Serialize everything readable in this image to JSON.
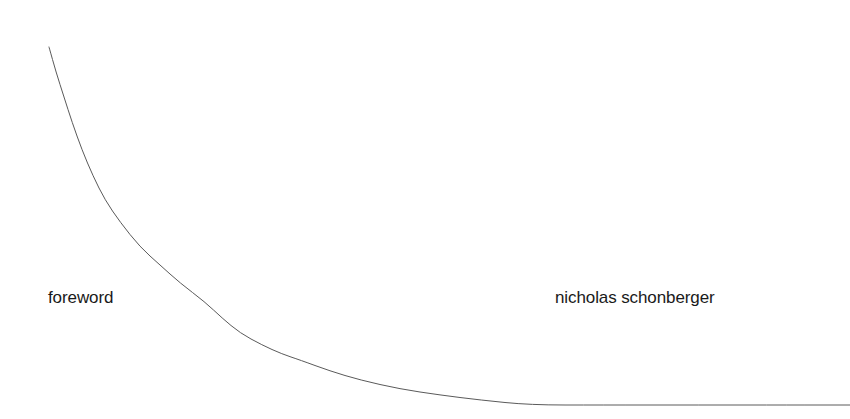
{
  "page": {
    "background_color": "#ffffff",
    "width": 850,
    "height": 419
  },
  "labels": {
    "section": "foreword",
    "author": "nicholas schonberger",
    "text_color": "#1a1a1a"
  },
  "chart_data": {
    "type": "line",
    "title": "",
    "subtitle": "",
    "xlabel": "",
    "ylabel": "",
    "grid": false,
    "legend": null,
    "axes_visible": false,
    "tick_labels_x": [],
    "tick_labels_y": [],
    "xlim": [
      0,
      850
    ],
    "ylim": [
      419,
      0
    ],
    "series": [
      {
        "name": "decay-curve",
        "color": "#5a5a5a",
        "line_width": 1,
        "x": [
          49,
          56,
          64,
          72,
          82,
          93,
          105,
          120,
          140,
          160,
          180,
          205,
          222,
          240,
          262,
          282,
          300,
          330,
          360,
          400,
          440,
          480,
          530,
          600,
          700,
          790,
          850
        ],
        "y": [
          47,
          72,
          97,
          122,
          150,
          176,
          200,
          222,
          247,
          265,
          283,
          302,
          318,
          333,
          345,
          354,
          360,
          371,
          380,
          389,
          395,
          400,
          405,
          405,
          405,
          405,
          405
        ]
      }
    ],
    "annotations": [
      {
        "name": "foreword",
        "text": "foreword",
        "x": 49,
        "y": 303
      },
      {
        "name": "author",
        "text": "nicholas schonberger",
        "x": 556,
        "y": 303
      }
    ]
  }
}
